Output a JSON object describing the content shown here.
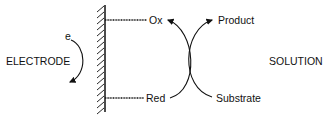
{
  "diagram": {
    "left_region": "ELECTRODE",
    "right_region": "SOLUTION",
    "electron_label": "e",
    "electrode_species": {
      "top": "Ox",
      "bottom": "Red"
    },
    "solution_species": {
      "top": "Product",
      "bottom": "Substrate"
    },
    "colors": {
      "stroke": "#111111",
      "background": "#ffffff"
    }
  }
}
